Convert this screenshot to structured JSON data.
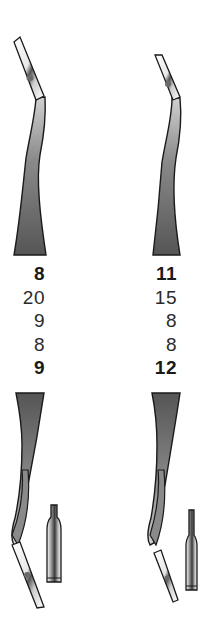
{
  "figure": {
    "instruments": [
      {
        "id": "left",
        "values": [
          {
            "text": "8",
            "bold": true
          },
          {
            "text": "20",
            "bold": false
          },
          {
            "text": "9",
            "bold": false
          },
          {
            "text": "8",
            "bold": false
          },
          {
            "text": "9",
            "bold": true
          }
        ]
      },
      {
        "id": "right",
        "values": [
          {
            "text": "11",
            "bold": true
          },
          {
            "text": "15",
            "bold": false
          },
          {
            "text": "8",
            "bold": false
          },
          {
            "text": "8",
            "bold": false
          },
          {
            "text": "12",
            "bold": true
          }
        ]
      }
    ]
  },
  "colors": {
    "outline": "#1a1a1a",
    "shaft_dark": "#4a4a4a",
    "shaft_light": "#d8d8d8",
    "background": "#ffffff"
  }
}
